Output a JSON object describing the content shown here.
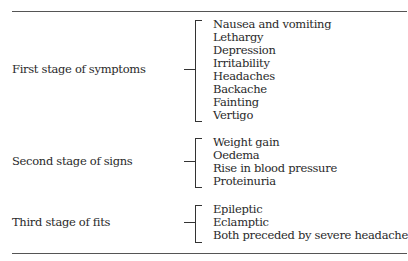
{
  "table": {
    "groups": [
      {
        "label": "First stage of symptoms",
        "items": [
          "Nausea and vomiting",
          "Lethargy",
          "Depression",
          "Irritability",
          "Headaches",
          "Backache",
          "Fainting",
          "Vertigo"
        ]
      },
      {
        "label": "Second stage of signs",
        "items": [
          "Weight gain",
          "Oedema",
          "Rise in blood pressure",
          "Proteinuria"
        ]
      },
      {
        "label": "Third stage of fits",
        "items": [
          "Epileptic",
          "Eclamptic",
          "Both preceded by severe headache"
        ]
      }
    ]
  }
}
